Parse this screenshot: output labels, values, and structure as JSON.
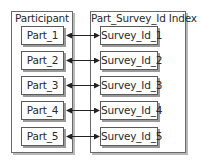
{
  "left_panel": {
    "title": "Participant",
    "items": [
      {
        "label": "Part_1"
      },
      {
        "label": "Part_2"
      },
      {
        "label": "Part_3"
      },
      {
        "label": "Part_4"
      },
      {
        "label": "Part_5"
      }
    ]
  },
  "right_panel": {
    "title": "Part_Survey_Id Index",
    "items": [
      {
        "label": "Survey_Id_1"
      },
      {
        "label": "Survey_Id_2"
      },
      {
        "label": "Survey_Id_3"
      },
      {
        "label": "Survey_Id_4"
      },
      {
        "label": "Survey_Id_5"
      }
    ]
  },
  "connections": [
    {
      "from": "Part_1",
      "to": "Survey_Id_1",
      "type": "bidirectional"
    },
    {
      "from": "Part_2",
      "to": "Survey_Id_2",
      "type": "bidirectional"
    },
    {
      "from": "Part_3",
      "to": "Survey_Id_3",
      "type": "bidirectional"
    },
    {
      "from": "Part_4",
      "to": "Survey_Id_4",
      "type": "bidirectional"
    },
    {
      "from": "Part_5",
      "to": "Survey_Id_5",
      "type": "bidirectional"
    }
  ],
  "colors": {
    "border": "#5a5a5a",
    "shadow": "#9a9a9a",
    "text": "#2a2a2a",
    "arrow": "#222222"
  }
}
